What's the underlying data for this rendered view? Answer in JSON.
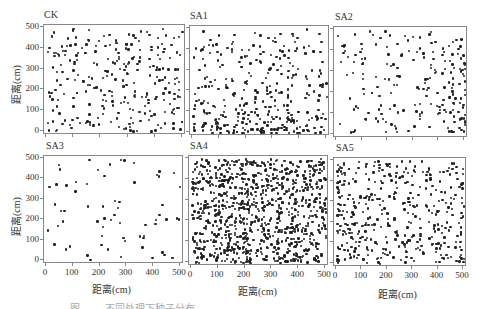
{
  "chart_data": [
    {
      "type": "scatter",
      "title": "CK",
      "xlabel": "",
      "ylabel": "距离(cm)",
      "xlim": [
        0,
        500
      ],
      "ylim": [
        0,
        500
      ],
      "xticks": [],
      "yticks": [
        0,
        100,
        200,
        300,
        400,
        500
      ],
      "grid": false,
      "density": "medium",
      "approx_points": 260
    },
    {
      "type": "scatter",
      "title": "SA1",
      "xlabel": "",
      "ylabel": "",
      "xlim": [
        0,
        500
      ],
      "ylim": [
        0,
        500
      ],
      "xticks": [],
      "yticks": [],
      "grid": false,
      "density": "medium, concentrated at low y (0-200)",
      "approx_points": 330
    },
    {
      "type": "scatter",
      "title": "SA2",
      "xlabel": "",
      "ylabel": "",
      "xlim": [
        0,
        500
      ],
      "ylim": [
        0,
        500
      ],
      "xticks": [],
      "yticks": [],
      "grid": false,
      "density": "medium, concentrated at high x (250-500)",
      "approx_points": 200
    },
    {
      "type": "scatter",
      "title": "SA3",
      "xlabel": "距离(cm)",
      "ylabel": "距离(cm)",
      "xlim": [
        0,
        500
      ],
      "ylim": [
        0,
        500
      ],
      "xticks": [
        0,
        100,
        200,
        300,
        400,
        500
      ],
      "yticks": [
        0,
        100,
        200,
        300,
        400,
        500
      ],
      "grid": false,
      "density": "sparse",
      "approx_points": 65
    },
    {
      "type": "scatter",
      "title": "SA4",
      "xlabel": "距离(cm)",
      "ylabel": "",
      "xlim": [
        0,
        500
      ],
      "ylim": [
        0,
        500
      ],
      "xticks": [
        0,
        100,
        200,
        300,
        400,
        500
      ],
      "yticks": [],
      "grid": false,
      "density": "very dense",
      "approx_points": 900
    },
    {
      "type": "scatter",
      "title": "SA5",
      "xlabel": "距离(cm)",
      "ylabel": "",
      "xlim": [
        0,
        500
      ],
      "ylim": [
        0,
        500
      ],
      "xticks": [
        0,
        100,
        200,
        300,
        400,
        500
      ],
      "yticks": [],
      "grid": false,
      "density": "medium-dense, concentrated at low x",
      "approx_points": 400
    }
  ],
  "panels": [
    {
      "title": "CK",
      "frame": [
        43,
        24,
        142,
        110
      ],
      "n": 260,
      "bias": "uniform",
      "seed": 11
    },
    {
      "title": "SA1",
      "frame": [
        189,
        25,
        140,
        110
      ],
      "n": 330,
      "bias": "lowy",
      "seed": 23
    },
    {
      "title": "SA2",
      "frame": [
        333,
        26,
        134,
        111
      ],
      "n": 200,
      "bias": "highx",
      "seed": 37
    },
    {
      "title": "SA3",
      "frame": [
        43,
        155,
        140,
        108
      ],
      "n": 65,
      "bias": "uniform",
      "seed": 53
    },
    {
      "title": "SA4",
      "frame": [
        188,
        155,
        140,
        110
      ],
      "n": 900,
      "bias": "uniform",
      "seed": 71
    },
    {
      "title": "SA5",
      "frame": [
        333,
        157,
        133,
        109
      ],
      "n": 400,
      "bias": "lowx",
      "seed": 89
    }
  ],
  "axis": {
    "ylabel": "距离(cm)",
    "xlabel": "距离(cm)",
    "ticks": [
      "0",
      "100",
      "200",
      "300",
      "400",
      "500"
    ]
  },
  "caption": "图 ……  不同处理下种子分布"
}
